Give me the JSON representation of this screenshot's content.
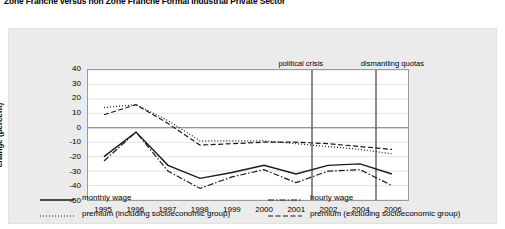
{
  "title": "Zone Franche versus non Zone Franche Formal Industrial Private Sector",
  "chart_data": {
    "type": "line",
    "title": "Zone Franche versus non Zone Franche Formal Industrial Private Sector",
    "xlabel": "",
    "ylabel": "change (percent)",
    "categories": [
      "1995",
      "1996",
      "1997",
      "1998",
      "1999",
      "2000",
      "2001",
      "2002",
      "2004",
      "2006"
    ],
    "x_tick_labels": [
      "1995",
      "1996",
      "1997",
      "1998",
      "1999",
      "2000",
      "2001",
      "2002",
      "2004",
      "2006"
    ],
    "y_tick_labels": [
      "40",
      "30",
      "20",
      "10",
      "0",
      "-10",
      "-20",
      "-30",
      "-40",
      "-50"
    ],
    "y_ticks": [
      40,
      30,
      20,
      10,
      0,
      -10,
      -20,
      -30,
      -40,
      -50
    ],
    "ylim": [
      -50,
      40
    ],
    "grid": true,
    "zero_line": 0,
    "legend_position": "bottom",
    "series": [
      {
        "name": "monthly wage",
        "style": "solid",
        "color": "#1a1a1a",
        "values": [
          -20,
          -3,
          -26,
          -35,
          -31,
          -26,
          -32,
          -26,
          -25,
          -32
        ]
      },
      {
        "name": "hourly wage",
        "style": "dash-dot",
        "color": "#1a1a1a",
        "values": [
          -23,
          -3,
          -30,
          -42,
          -34,
          -29,
          -38,
          -30,
          -29,
          -40
        ]
      },
      {
        "name": "premium (including socioeconomic group)",
        "style": "dotted",
        "color": "#1a1a1a",
        "values": [
          14,
          16,
          5,
          -9,
          -9,
          -9,
          -11,
          -13,
          -15,
          -18
        ]
      },
      {
        "name": "premium (excluding socioeconomic group)",
        "style": "dashed",
        "color": "#1a1a1a",
        "values": [
          9,
          16,
          3,
          -12,
          -11,
          -10,
          -10,
          -11,
          -13,
          -15
        ]
      }
    ],
    "annotations": [
      {
        "label": "political crisis",
        "x_position": 6.5
      },
      {
        "label": "dismantling quotas",
        "x_position": 8.5
      }
    ]
  },
  "legend": {
    "items": [
      {
        "label": "monthly wage",
        "style": "solid"
      },
      {
        "label": "hourly wage",
        "style": "dash-dot"
      },
      {
        "label": "premium (including socioeconomic group)",
        "style": "dotted"
      },
      {
        "label": "premium (excluding socioeconomic group)",
        "style": "dashed"
      }
    ]
  }
}
